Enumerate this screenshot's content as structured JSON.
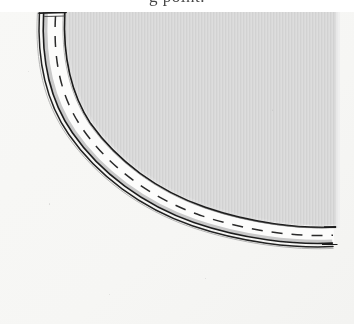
{
  "figure": {
    "kind": "scanned-line-drawing",
    "width": 354,
    "height": 324
  },
  "caption": {
    "text": "g  point.",
    "note": "caption is cropped off the top edge; only the lower fragments of the glyphs are visible"
  },
  "colors": {
    "page_background": "#ffffff",
    "outer_field": "#f7f7f5",
    "inner_field_gray": "#d9d9d9",
    "inner_field_gray_light": "#e4e4e4",
    "road_fill_white": "#fcfcfb",
    "shoulder_gray": "#c9c9c9",
    "ink_dark": "#1f1f1f",
    "ink_mid": "#555555"
  },
  "geometry": {
    "inner_field_top_y": 12,
    "inner_field_right_x": 338,
    "road_start_top": {
      "x": 40,
      "y": 12
    },
    "road_end_right": {
      "x": 338,
      "y": 252
    },
    "curve_description": "quarter-turn arc sweeping from vertical at upper-left to horizontal at right"
  },
  "layers": [
    {
      "name": "inner-shaded-field",
      "fill": "#d9d9d9",
      "pattern": "vertical halftone striping"
    },
    {
      "name": "road-inner-edge-line",
      "stroke": "#1f1f1f",
      "width_px": 1.6,
      "style": "solid, slightly ragged"
    },
    {
      "name": "road-surface",
      "fill": "#fcfcfb"
    },
    {
      "name": "road-centerline",
      "stroke": "#2a2a2a",
      "width_px": 1.4,
      "style": "dashed"
    },
    {
      "name": "road-shoulder-strip",
      "fill": "#c9c9c9"
    },
    {
      "name": "road-outer-edge-line",
      "stroke": "#1f1f1f",
      "width_px": 1.5,
      "style": "solid"
    },
    {
      "name": "road-outer-edge-line-2",
      "stroke": "#1f1f1f",
      "width_px": 1.2,
      "style": "solid, parallel offset"
    },
    {
      "name": "road-top-cap",
      "stroke": "#1f1f1f",
      "style": "short solid cap across band at top"
    }
  ],
  "dash_pattern": {
    "dash_px": 11,
    "gap_px": 9
  },
  "labels": {
    "outer_field": "outer field",
    "inner_field": "shaded inner field",
    "road": "roadway",
    "centerline": "dashed centerline"
  }
}
